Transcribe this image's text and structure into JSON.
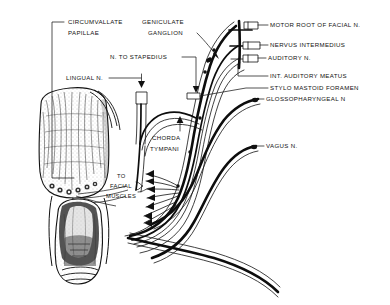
{
  "figure": {
    "background_color": "#ffffff",
    "ink_color": "#111111",
    "width": 390,
    "height": 305
  },
  "labels": {
    "circumvallate_papillae_line1": "CIRCUMVALLATE",
    "circumvallate_papillae_line2": "PAPILLAE",
    "geniculate_ganglion_line1": "GENICULATE",
    "geniculate_ganglion_line2": "GANGLION",
    "n_to_stapedius": "N. TO STAPEDIUS",
    "lingual_n": "LINGUAL N.",
    "chorda_tympani_line1": "CHORDA",
    "chorda_tympani_line2": "TYMPANI",
    "to_facial_muscles_line1": "TO",
    "to_facial_muscles_line2": "FACIAL",
    "to_facial_muscles_line3": "MUSCLES",
    "motor_root_of_facial_n": "MOTOR ROOT OF FACIAL N.",
    "nervus_intermedius": "NERVUS INTERMEDIUS",
    "auditory_n": "AUDITORY N.",
    "int_auditory_meatus": "INT. AUDITORY MEATUS",
    "stylo_mastoid_foramen": "STYLO MASTOID FORAMEN",
    "glossopharyngeal_n": "GLOSSOPHARYNGEAL N",
    "vagus_n": "VAGUS N."
  },
  "anatomy": {
    "tongue": "tongue-dorsum-illustration",
    "larynx": "larynx-epiglottis-illustration",
    "nerve_bundle": "cranial-nerve-trunk-bundle"
  }
}
